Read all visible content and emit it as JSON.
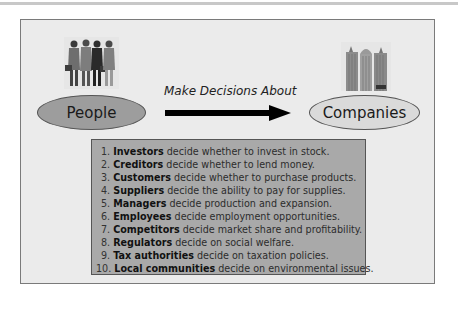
{
  "diagram": {
    "people": {
      "label": "People",
      "icon": "group-of-businesspeople-icon",
      "fill": "#9d9d9d"
    },
    "companies": {
      "label": "Companies",
      "icon": "office-buildings-icon",
      "fill": "#dadada"
    },
    "connector": {
      "label": "Make Decisions About",
      "direction": "people-to-companies"
    },
    "decisions": [
      {
        "num": "1.",
        "actor": "Investors",
        "text": " decide whether to invest in stock."
      },
      {
        "num": "2.",
        "actor": "Creditors",
        "text": " decide whether to lend money."
      },
      {
        "num": "3.",
        "actor": "Customers",
        "text": " decide whether to purchase products."
      },
      {
        "num": "4.",
        "actor": "Suppliers",
        "text": " decide the ability to pay for supplies."
      },
      {
        "num": "5.",
        "actor": "Managers",
        "text": " decide production and expansion."
      },
      {
        "num": "6.",
        "actor": "Employees",
        "text": " decide employment opportunities."
      },
      {
        "num": "7.",
        "actor": "Competitors",
        "text": " decide market share and profitability."
      },
      {
        "num": "8.",
        "actor": "Regulators",
        "text": " decide on social welfare."
      },
      {
        "num": "9.",
        "actor": "Tax authorities",
        "text": " decide on taxation policies."
      },
      {
        "num": "10.",
        "actor": "Local communities",
        "text": " decide on environmental issues."
      }
    ],
    "colors": {
      "frame_bg": "#ebebeb",
      "list_bg": "#a9a9a9",
      "border": "#555555"
    }
  }
}
